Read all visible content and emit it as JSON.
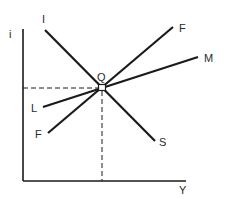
{
  "diagram": {
    "type": "IS-LM-style equilibrium diagram",
    "axes": {
      "y_label": "i",
      "x_label": "Y"
    },
    "curves": [
      {
        "name": "IS",
        "start_label": "I",
        "end_label": "S",
        "slope": "downward"
      },
      {
        "name": "FF",
        "start_label": "F",
        "end_label": "F",
        "slope": "upward"
      },
      {
        "name": "LM",
        "start_label": "L",
        "end_label": "M",
        "slope": "upward"
      }
    ],
    "equilibrium": {
      "label": "Q",
      "guides": "dashed lines to both axes"
    },
    "colors": {
      "line": "#1a1a1a",
      "background": "#ffffff"
    }
  }
}
